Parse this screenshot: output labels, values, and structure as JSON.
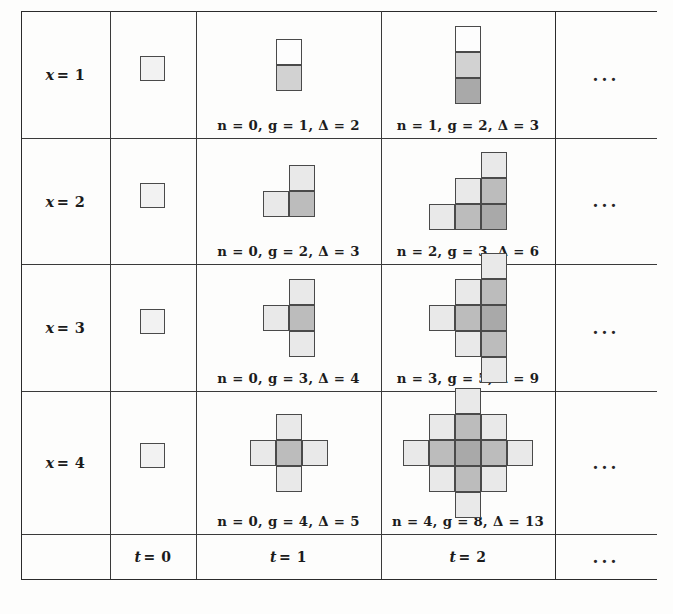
{
  "figure": {
    "kind": "growth-table",
    "columns": [
      {
        "id": "rowhdr",
        "label": ""
      },
      {
        "id": "t0",
        "label": "t = 0",
        "sym": "t",
        "value": "= 0"
      },
      {
        "id": "t1",
        "label": "t = 1",
        "sym": "t",
        "value": "= 1"
      },
      {
        "id": "t2",
        "label": "t = 2",
        "sym": "t",
        "value": "= 2"
      },
      {
        "id": "more",
        "label": "..."
      }
    ],
    "row_labels": [
      {
        "sym": "x",
        "value": "= 1",
        "label": "x = 1"
      },
      {
        "sym": "x",
        "value": "= 2",
        "label": "x = 2"
      },
      {
        "sym": "x",
        "value": "= 3",
        "label": "x = 3"
      },
      {
        "sym": "x",
        "value": "= 4",
        "label": "x = 4"
      }
    ],
    "ellipsis": "...",
    "captions": {
      "t1": [
        "n = 0, g = 1, Δ = 2",
        "n = 0, g = 2, Δ = 3",
        "n = 0, g = 3, Δ = 4",
        "n = 0, g = 4, Δ = 5"
      ],
      "t2": [
        "n = 1, g = 2, Δ = 3",
        "n = 2, g = 3, Δ = 6",
        "n = 3, g = 5, Δ = 9",
        "n = 4, g = 8, Δ = 13"
      ]
    },
    "stats": {
      "t1": [
        {
          "n": 0,
          "g": 1,
          "delta": 2
        },
        {
          "n": 0,
          "g": 2,
          "delta": 3
        },
        {
          "n": 0,
          "g": 3,
          "delta": 4
        },
        {
          "n": 0,
          "g": 4,
          "delta": 5
        }
      ],
      "t2": [
        {
          "n": 1,
          "g": 2,
          "delta": 3
        },
        {
          "n": 2,
          "g": 3,
          "delta": 6
        },
        {
          "n": 3,
          "g": 5,
          "delta": 9
        },
        {
          "n": 4,
          "g": 8,
          "delta": 13
        }
      ]
    },
    "colors": {
      "rule": "#2b2b2b",
      "square_border": "#4a4a4a",
      "shade_0": "#fdfdfd",
      "shade_1": "#e9e9e9",
      "shade_2": "#d2d2d2",
      "shade_3": "#bcbcbc",
      "shade_4": "#a9a9a9",
      "text": "#1b1b1b",
      "paper": "#fdfdfc"
    },
    "shapes": {
      "unit": 26,
      "t0": [
        {
          "cells": [
            {
              "cx": 0,
              "cy": 0,
              "shade": 1
            }
          ]
        },
        {
          "cells": [
            {
              "cx": 0,
              "cy": 0,
              "shade": 1
            }
          ]
        },
        {
          "cells": [
            {
              "cx": 0,
              "cy": 0,
              "shade": 1
            }
          ]
        },
        {
          "cells": [
            {
              "cx": 0,
              "cy": 0,
              "shade": 1
            }
          ]
        }
      ],
      "t1": [
        {
          "cells": [
            {
              "cx": 0,
              "cy": 0,
              "shade": 0
            },
            {
              "cx": 0,
              "cy": 1,
              "shade": 2
            }
          ]
        },
        {
          "cells": [
            {
              "cx": 1,
              "cy": 0,
              "shade": 1
            },
            {
              "cx": 0,
              "cy": 1,
              "shade": 1
            },
            {
              "cx": 1,
              "cy": 1,
              "shade": 3
            }
          ]
        },
        {
          "cells": [
            {
              "cx": 1,
              "cy": 0,
              "shade": 1
            },
            {
              "cx": 0,
              "cy": 1,
              "shade": 1
            },
            {
              "cx": 1,
              "cy": 1,
              "shade": 3
            },
            {
              "cx": 1,
              "cy": 2,
              "shade": 1
            }
          ]
        },
        {
          "cells": [
            {
              "cx": 1,
              "cy": 0,
              "shade": 1
            },
            {
              "cx": 0,
              "cy": 1,
              "shade": 1
            },
            {
              "cx": 1,
              "cy": 1,
              "shade": 3
            },
            {
              "cx": 2,
              "cy": 1,
              "shade": 1
            },
            {
              "cx": 1,
              "cy": 2,
              "shade": 1
            }
          ]
        }
      ],
      "t2": [
        {
          "cells": [
            {
              "cx": 0,
              "cy": 0,
              "shade": 0
            },
            {
              "cx": 0,
              "cy": 1,
              "shade": 2
            },
            {
              "cx": 0,
              "cy": 2,
              "shade": 4
            }
          ]
        },
        {
          "cells": [
            {
              "cx": 2,
              "cy": 0,
              "shade": 1
            },
            {
              "cx": 1,
              "cy": 1,
              "shade": 1
            },
            {
              "cx": 2,
              "cy": 1,
              "shade": 3
            },
            {
              "cx": 0,
              "cy": 2,
              "shade": 1
            },
            {
              "cx": 1,
              "cy": 2,
              "shade": 3
            },
            {
              "cx": 2,
              "cy": 2,
              "shade": 4
            }
          ]
        },
        {
          "cells": [
            {
              "cx": 2,
              "cy": 0,
              "shade": 1
            },
            {
              "cx": 1,
              "cy": 1,
              "shade": 1
            },
            {
              "cx": 2,
              "cy": 1,
              "shade": 3
            },
            {
              "cx": 0,
              "cy": 2,
              "shade": 1
            },
            {
              "cx": 1,
              "cy": 2,
              "shade": 3
            },
            {
              "cx": 2,
              "cy": 2,
              "shade": 4
            },
            {
              "cx": 1,
              "cy": 3,
              "shade": 1
            },
            {
              "cx": 2,
              "cy": 3,
              "shade": 3
            },
            {
              "cx": 2,
              "cy": 4,
              "shade": 1
            }
          ]
        },
        {
          "cells": [
            {
              "cx": 2,
              "cy": 0,
              "shade": 1
            },
            {
              "cx": 1,
              "cy": 1,
              "shade": 1
            },
            {
              "cx": 2,
              "cy": 1,
              "shade": 3
            },
            {
              "cx": 3,
              "cy": 1,
              "shade": 1
            },
            {
              "cx": 0,
              "cy": 2,
              "shade": 1
            },
            {
              "cx": 1,
              "cy": 2,
              "shade": 3
            },
            {
              "cx": 2,
              "cy": 2,
              "shade": 4
            },
            {
              "cx": 3,
              "cy": 2,
              "shade": 3
            },
            {
              "cx": 4,
              "cy": 2,
              "shade": 1
            },
            {
              "cx": 1,
              "cy": 3,
              "shade": 1
            },
            {
              "cx": 2,
              "cy": 3,
              "shade": 3
            },
            {
              "cx": 3,
              "cy": 3,
              "shade": 1
            },
            {
              "cx": 2,
              "cy": 4,
              "shade": 1
            }
          ]
        }
      ]
    }
  }
}
